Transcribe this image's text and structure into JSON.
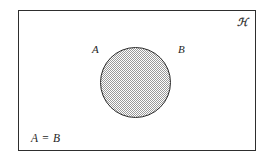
{
  "figure": {
    "name": "venn-diagram-a-equals-b",
    "caption": "Venn diagram in which set A coincides exactly with set B",
    "background_color": "#ffffff",
    "universe": {
      "symbol": "ℋ",
      "symbol_name": "script-capital-u",
      "symbol_reading": "U",
      "border_color": "#2e2e2e",
      "fill_color": "#ffffff"
    },
    "circle": {
      "label_left": "A",
      "label_right": "B",
      "fill_style": "stippled-gray",
      "fill_color": "#9a9a9a",
      "outline_color": "#2b2b2b"
    },
    "relation_label": "A = B"
  }
}
